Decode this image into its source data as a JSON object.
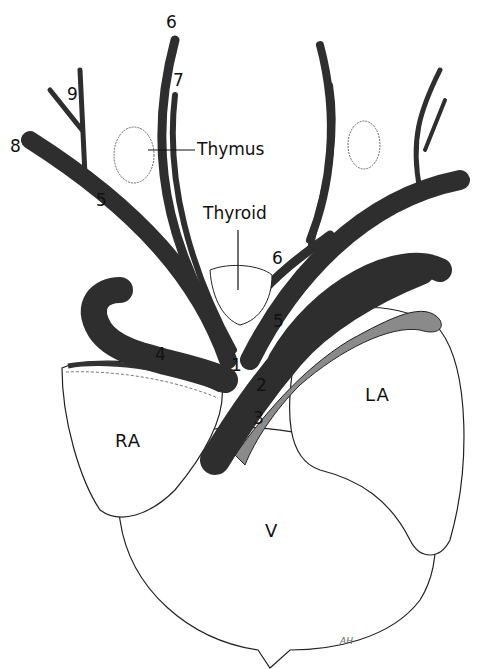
{
  "figure": {
    "type": "anatomical-illustration",
    "colors": {
      "vessel_dark": "#2e2e2e",
      "vessel_grey": "#8a8a8a",
      "outline": "#222222",
      "tissue_fill": "#ffffff",
      "stipple": "#555555"
    }
  },
  "labels": {
    "thymus": "Thymus",
    "thyroid": "Thyroid",
    "ra": "RA",
    "la": "LA",
    "v": "V",
    "n1": "1",
    "n2": "2",
    "n3": "3",
    "n4": "4",
    "n5_left": "5",
    "n5_center": "5",
    "n6_top": "6",
    "n6_right": "6",
    "n7": "7",
    "n8": "8",
    "n9": "9",
    "signature": "AH"
  }
}
